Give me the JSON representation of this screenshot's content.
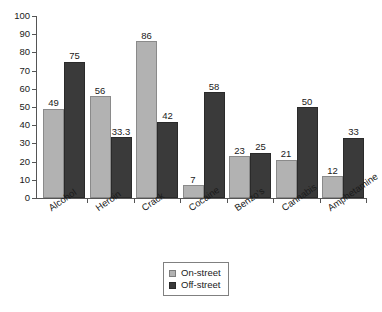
{
  "chart_data": {
    "type": "bar",
    "title": "",
    "subtitle": "",
    "xlabel": "",
    "ylabel": "",
    "ylim": [
      0,
      100
    ],
    "yticks": [
      0,
      10,
      20,
      30,
      40,
      50,
      60,
      70,
      80,
      90,
      100
    ],
    "grid": false,
    "legend_position": "bottom-center",
    "categories": [
      "Alcohol",
      "Heroin",
      "Crack",
      "Cocaine",
      "Benzo's",
      "Cannabis",
      "Amphetamine"
    ],
    "series": [
      {
        "name": "On-street",
        "color": "#b2b2b2",
        "values": [
          49,
          56,
          86,
          7,
          23,
          21,
          12
        ],
        "labels": [
          "49",
          "56",
          "86",
          "7",
          "23",
          "21",
          "12"
        ]
      },
      {
        "name": "Off-street",
        "color": "#3a3a3a",
        "values": [
          75,
          33.3,
          42,
          58,
          25,
          50,
          33
        ],
        "labels": [
          "75",
          "33.3",
          "42",
          "58",
          "25",
          "50",
          "33"
        ]
      }
    ]
  },
  "axis": {
    "y_tick_labels": [
      "0",
      "10",
      "20",
      "30",
      "40",
      "50",
      "60",
      "70",
      "80",
      "90",
      "100"
    ]
  },
  "legend": {
    "entries": [
      {
        "label": "On-street",
        "swatch": "light-gray-square"
      },
      {
        "label": "Off-street",
        "swatch": "dark-gray-square"
      }
    ]
  }
}
